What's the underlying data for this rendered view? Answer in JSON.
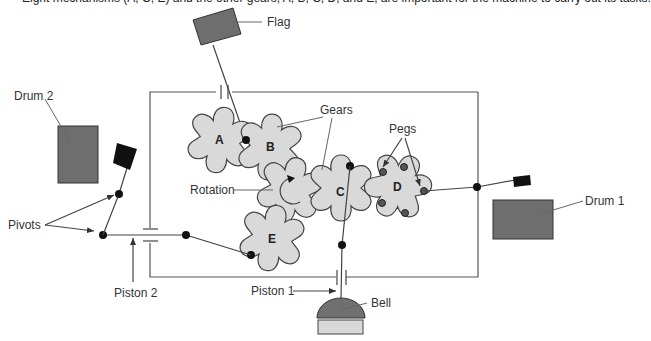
{
  "caption": "Eight mechanisms (A, C, E) and the other gears, A, B, C, D, and E, are important for the machine to carry out its tasks.",
  "labels": {
    "flag": "Flag",
    "gears": "Gears",
    "pegs": "Pegs",
    "drum1": "Drum 1",
    "drum2": "Drum 2",
    "pivots": "Pivots",
    "rotation": "Rotation",
    "piston1": "Piston 1",
    "piston2": "Piston 2",
    "bell": "Bell"
  },
  "gears": [
    {
      "id": "A",
      "label": "A"
    },
    {
      "id": "B",
      "label": "B"
    },
    {
      "id": "C",
      "label": "C"
    },
    {
      "id": "D",
      "label": "D"
    },
    {
      "id": "E",
      "label": "E"
    }
  ],
  "colors": {
    "gear_fill": "#d9d9d9",
    "drum_fill": "#6e6e6e",
    "flag_fill": "#6e6e6e",
    "bell_fill": "#707070",
    "bell_base": "#d9d9d9",
    "hammer": "#111111"
  }
}
